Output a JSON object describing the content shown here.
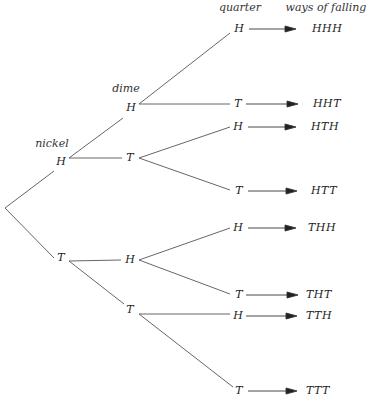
{
  "headers": {
    "nickel": "nickel",
    "dime": "dime",
    "quarter": "quarter",
    "outcomes": "ways of falling"
  },
  "nickel": {
    "H": "H",
    "T": "T"
  },
  "dime": [
    "H",
    "T",
    "H",
    "T"
  ],
  "quarter": [
    "H",
    "T",
    "H",
    "T",
    "H",
    "T",
    "H",
    "T"
  ],
  "outcomes": [
    "HHH",
    "HHT",
    "HTH",
    "HTT",
    "THH",
    "THT",
    "TTH",
    "TTT"
  ],
  "colors": {
    "line": "#555555",
    "text": "#222222"
  }
}
